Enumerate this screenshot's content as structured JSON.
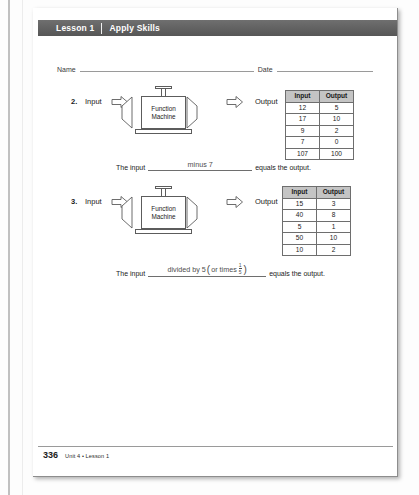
{
  "header": {
    "lesson_label": "Lesson 1",
    "title": "Apply Skills"
  },
  "fields": {
    "name_label": "Name",
    "date_label": "Date"
  },
  "problems": [
    {
      "number": "2.",
      "input_label": "Input",
      "output_label": "Output",
      "machine_line1": "Function",
      "machine_line2": "Machine",
      "table": {
        "headers": [
          "Input",
          "Output"
        ],
        "rows": [
          [
            "12",
            "5"
          ],
          [
            "17",
            "10"
          ],
          [
            "9",
            "2"
          ],
          [
            "7",
            "0"
          ],
          [
            "107",
            "100"
          ]
        ]
      },
      "answer": {
        "prefix": "The input",
        "response": "minus 7",
        "suffix": "equals the output."
      }
    },
    {
      "number": "3.",
      "input_label": "Input",
      "output_label": "Output",
      "machine_line1": "Function",
      "machine_line2": "Machine",
      "table": {
        "headers": [
          "Input",
          "Output"
        ],
        "rows": [
          [
            "15",
            "3"
          ],
          [
            "40",
            "8"
          ],
          [
            "5",
            "1"
          ],
          [
            "50",
            "10"
          ],
          [
            "10",
            "2"
          ]
        ]
      },
      "answer": {
        "prefix": "The input",
        "response_part1": "divided by 5",
        "response_paren_open": "(",
        "response_part2": "or times",
        "fraction_numerator": "1",
        "fraction_denominator": "5",
        "response_paren_close": ")",
        "suffix": "equals the output."
      }
    }
  ],
  "footer": {
    "page_number": "336",
    "unit_lesson": "Unit 4 • Lesson 1"
  },
  "colors": {
    "band": "#565656",
    "table_header": "#c4c4c4",
    "rule": "#9a9a9a",
    "ink": "#1a1a1a"
  }
}
